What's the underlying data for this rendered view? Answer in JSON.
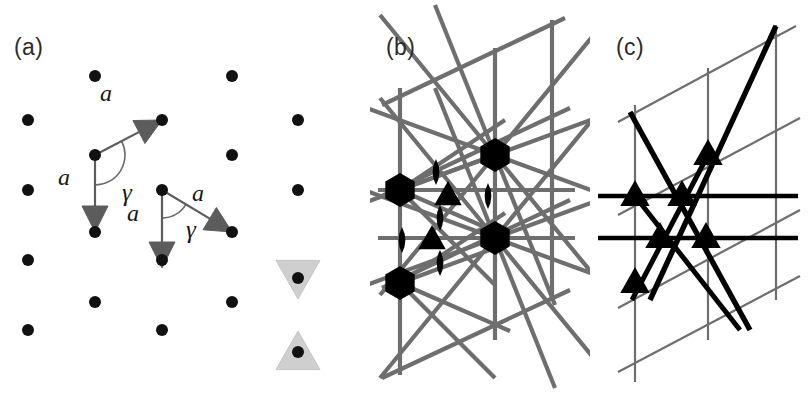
{
  "figure": {
    "background": "#ffffff",
    "width": 810,
    "height": 396,
    "dot_color": "#111111",
    "vector_color": "#5c5c5c",
    "symbol_color": "#000000",
    "thin_line_color": "#6e6e6e",
    "bold_line_color": "#000000",
    "faint_triangle_color": "#cfcfcf"
  },
  "panels": [
    {
      "id": "a",
      "label": "(a)",
      "caption_text": "(a)"
    },
    {
      "id": "b",
      "label": "(b)",
      "caption_text": "(b)"
    },
    {
      "id": "c",
      "label": "(c)",
      "caption_text": "(c)"
    }
  ],
  "panel_a": {
    "label": "(a)",
    "description": "hexagonal lattice of points with two unit-cell vector pairs",
    "lattice_points": [
      {
        "x": 28,
        "y": 120
      },
      {
        "x": 28,
        "y": 190
      },
      {
        "x": 28,
        "y": 260
      },
      {
        "x": 28,
        "y": 330
      },
      {
        "x": 95,
        "y": 76
      },
      {
        "x": 95,
        "y": 155
      },
      {
        "x": 95,
        "y": 232
      },
      {
        "x": 95,
        "y": 302
      },
      {
        "x": 162,
        "y": 120
      },
      {
        "x": 162,
        "y": 190
      },
      {
        "x": 162,
        "y": 260
      },
      {
        "x": 162,
        "y": 330
      },
      {
        "x": 232,
        "y": 76
      },
      {
        "x": 232,
        "y": 155
      },
      {
        "x": 232,
        "y": 232
      },
      {
        "x": 232,
        "y": 302
      },
      {
        "x": 298,
        "y": 120
      },
      {
        "x": 298,
        "y": 190
      },
      {
        "x": 298,
        "y": 278
      },
      {
        "x": 298,
        "y": 352
      }
    ],
    "dot_radius": 6,
    "vector_sets": [
      {
        "name": "cell-1",
        "origin": {
          "x": 95,
          "y": 155
        },
        "arrows": [
          {
            "name": "a1",
            "to": {
              "x": 162,
              "y": 120
            },
            "label": "a",
            "label_pos": {
              "x": 108,
              "y": 98
            }
          },
          {
            "name": "a2",
            "to": {
              "x": 95,
              "y": 232
            },
            "label": "a",
            "label_pos": {
              "x": 62,
              "y": 180
            }
          }
        ],
        "angle": {
          "symbol": "γ",
          "pos": {
            "x": 120,
            "y": 185
          },
          "arc_radius": 30
        }
      },
      {
        "name": "cell-2",
        "origin": {
          "x": 162,
          "y": 190
        },
        "arrows": [
          {
            "name": "a1",
            "to": {
              "x": 232,
              "y": 232
            },
            "label": "a",
            "label_pos": {
              "x": 196,
              "y": 196
            }
          },
          {
            "name": "a2",
            "to": {
              "x": 162,
              "y": 268
            },
            "label": "a",
            "label_pos": {
              "x": 131,
              "y": 216
            }
          }
        ],
        "angle": {
          "symbol": "γ",
          "pos": {
            "x": 186,
            "y": 222
          },
          "arc_radius": 28
        }
      }
    ],
    "symmetry_triangles": [
      {
        "name": "triangle-down",
        "cx": 298,
        "cy": 278,
        "orientation": "down",
        "size": 22
      },
      {
        "name": "triangle-up",
        "cx": 298,
        "cy": 352,
        "orientation": "up",
        "size": 22
      }
    ]
  },
  "panel_b": {
    "label": "(b)",
    "description": "p6mm plane-group symmetry diagram: mirror lines with 6-fold, 3-fold and 2-fold rotation symbols",
    "symbols": [
      {
        "name": "hexagon-6fold",
        "type": "hexagon",
        "x": 30,
        "y": 190,
        "size": 17
      },
      {
        "name": "hexagon-6fold",
        "type": "hexagon",
        "x": 30,
        "y": 283,
        "size": 17
      },
      {
        "name": "hexagon-6fold",
        "type": "hexagon",
        "x": 125,
        "y": 155,
        "size": 17
      },
      {
        "name": "hexagon-6fold",
        "type": "hexagon",
        "x": 125,
        "y": 238,
        "size": 17
      },
      {
        "name": "triangle-3fold",
        "type": "triangle",
        "x": 78,
        "y": 196,
        "size": 15
      },
      {
        "name": "triangle-3fold",
        "type": "triangle",
        "x": 62,
        "y": 240,
        "size": 15
      },
      {
        "name": "lens-2fold",
        "type": "lens",
        "x": 66,
        "y": 172,
        "size": 13
      },
      {
        "name": "lens-2fold",
        "type": "lens",
        "x": 70,
        "y": 218,
        "size": 13
      },
      {
        "name": "lens-2fold",
        "type": "lens",
        "x": 70,
        "y": 263,
        "size": 13
      },
      {
        "name": "lens-2fold",
        "type": "lens",
        "x": 32,
        "y": 240,
        "size": 13
      },
      {
        "name": "lens-2fold",
        "type": "lens",
        "x": 118,
        "y": 196,
        "size": 13
      }
    ]
  },
  "panel_c": {
    "label": "(c)",
    "description": "p3m1 plane-group symmetry diagram: bold and thin mirror lines with 3-fold triangle symbols",
    "symbols": [
      {
        "name": "triangle-3fold",
        "x": 45,
        "y": 196,
        "size": 16
      },
      {
        "name": "triangle-3fold",
        "x": 92,
        "y": 196,
        "size": 16
      },
      {
        "name": "triangle-3fold",
        "x": 70,
        "y": 238,
        "size": 16
      },
      {
        "name": "triangle-3fold",
        "x": 116,
        "y": 238,
        "size": 16
      },
      {
        "name": "triangle-3fold",
        "x": 45,
        "y": 283,
        "size": 16
      },
      {
        "name": "triangle-3fold",
        "x": 118,
        "y": 155,
        "size": 16
      }
    ]
  },
  "chart_data": {
    "type": "diagram",
    "title": "",
    "subfigures": [
      {
        "label": "(a)",
        "content": "hexagonal point lattice with two equivalent primitive cells",
        "annotations": [
          "a",
          "a",
          "γ",
          "a",
          "a",
          "γ"
        ],
        "lattice_type": "hexagonal",
        "rows": 4,
        "columns": 5,
        "row_spacing": 70,
        "column_spacing": 67
      },
      {
        "label": "(b)",
        "content": "p6mm symmetry diagram",
        "symbol_counts": {
          "6-fold hexagon": 4,
          "3-fold triangle": 2,
          "2-fold lens": 5
        }
      },
      {
        "label": "(c)",
        "content": "p3m1 symmetry diagram",
        "symbol_counts": {
          "3-fold triangle": 6
        }
      }
    ]
  }
}
